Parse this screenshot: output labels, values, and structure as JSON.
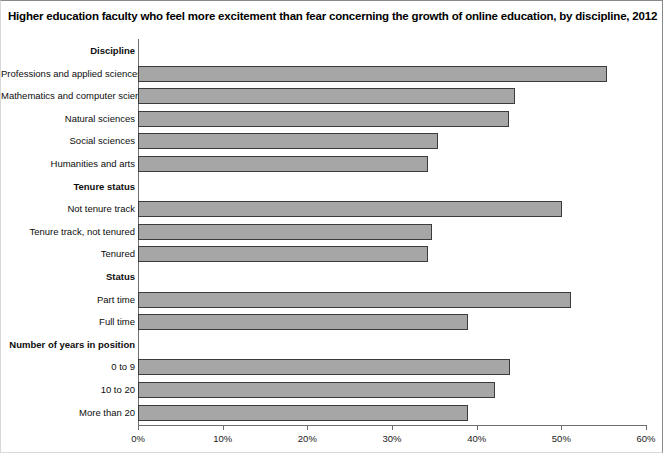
{
  "title": "Higher education faculty who feel more excitement than fear concerning the growth of online education, by discipline, 2012",
  "axis": {
    "x_ticks": [
      "0%",
      "10%",
      "20%",
      "30%",
      "40%",
      "50%",
      "60%"
    ]
  },
  "colors": {
    "bar_fill": "#a6a6a6",
    "bar_stroke": "#3b3b3b",
    "axis": "#6e6e6e",
    "text": "#0d0d0d",
    "background": "#ffffff"
  },
  "chart_data": {
    "type": "bar",
    "orientation": "horizontal",
    "title": "Higher education faculty who feel more excitement than fear concerning the growth of online education, by discipline, 2012",
    "xlabel": "",
    "ylabel": "",
    "xlim": [
      0,
      60
    ],
    "grid": false,
    "legend": null,
    "tick_labels": [
      "0%",
      "10%",
      "20%",
      "30%",
      "40%",
      "50%",
      "60%"
    ],
    "tick_values": [
      0,
      10,
      20,
      30,
      40,
      50,
      60
    ],
    "rows": [
      {
        "label": "Discipline",
        "group": true,
        "value": null
      },
      {
        "label": "Professions and applied sciences",
        "group": false,
        "value": 55.4
      },
      {
        "label": "Mathematics and computer science",
        "group": false,
        "value": 44.5
      },
      {
        "label": "Natural sciences",
        "group": false,
        "value": 43.8
      },
      {
        "label": "Social sciences",
        "group": false,
        "value": 35.4
      },
      {
        "label": "Humanities and arts",
        "group": false,
        "value": 34.2
      },
      {
        "label": "Tenure status",
        "group": true,
        "value": null
      },
      {
        "label": "Not tenure track",
        "group": false,
        "value": 50.1
      },
      {
        "label": "Tenure track, not tenured",
        "group": false,
        "value": 34.7
      },
      {
        "label": "Tenured",
        "group": false,
        "value": 34.2
      },
      {
        "label": "Status",
        "group": true,
        "value": null
      },
      {
        "label": "Part time",
        "group": false,
        "value": 51.1
      },
      {
        "label": "Full time",
        "group": false,
        "value": 39.0
      },
      {
        "label": "Number of  years in position",
        "group": true,
        "value": null
      },
      {
        "label": "0 to 9",
        "group": false,
        "value": 43.9
      },
      {
        "label": "10 to 20",
        "group": false,
        "value": 42.2
      },
      {
        "label": "More than 20",
        "group": false,
        "value": 39.0
      }
    ],
    "categories": [
      "Professions and applied sciences",
      "Mathematics and computer science",
      "Natural sciences",
      "Social sciences",
      "Humanities and arts",
      "Not tenure track",
      "Tenure track, not tenured",
      "Tenured",
      "Part time",
      "Full time",
      "0 to 9",
      "10 to 20",
      "More than 20"
    ],
    "values": [
      55.4,
      44.5,
      43.8,
      35.4,
      34.2,
      50.1,
      34.7,
      34.2,
      51.1,
      39.0,
      43.9,
      42.2,
      39.0
    ]
  }
}
